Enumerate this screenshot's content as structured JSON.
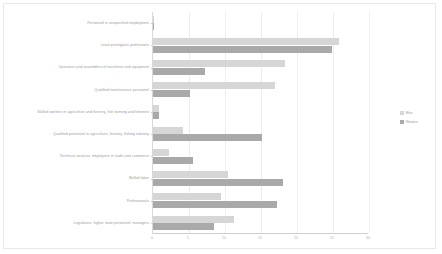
{
  "chart_data": {
    "type": "bar",
    "orientation": "horizontal",
    "title": "",
    "subtitle": "",
    "xlabel": "",
    "ylabel": "",
    "xlim": [
      0,
      30
    ],
    "xticks": [
      "0",
      "5",
      "10",
      "15",
      "20",
      "25",
      "30"
    ],
    "grid": true,
    "legend_position": "right",
    "categories": [
      "Personnel in unspecified employment",
      "Least prestigious professions",
      "Operators and assemblers of machines and equipment",
      "Qualified maintenance personnel",
      "Skilled workers in agriculture and forestry, fish farming and fisheries",
      "Qualified personnel in agriculture, forestry, fishing industry",
      "Technical services, employees in trade and commerce",
      "Skilled labor",
      "Professionals",
      "Legislators, higher state personnel, managers"
    ],
    "series": [
      {
        "name": "Men",
        "color": "#d6d6d6",
        "values": [
          0.1,
          25.8,
          18.3,
          16.9,
          0.8,
          4.2,
          2.2,
          10.4,
          9.4,
          11.2
        ]
      },
      {
        "name": "Women",
        "color": "#a9a9a9",
        "values": [
          0.1,
          24.8,
          7.2,
          5.2,
          0.9,
          15.2,
          5.5,
          18.0,
          17.2,
          8.5
        ]
      }
    ]
  },
  "legend": {
    "entries": [
      {
        "label": "Men"
      },
      {
        "label": "Women"
      }
    ]
  },
  "colors": {
    "men": "#d6d6d6",
    "women": "#a9a9a9",
    "gridline": "#ededed",
    "axis": "#cfcfcf",
    "label_text": "#9a9a9a",
    "background": "#ffffff"
  }
}
